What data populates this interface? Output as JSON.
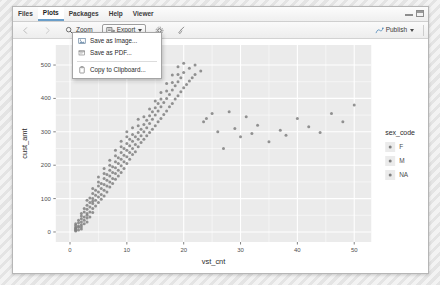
{
  "window": {
    "tabs": [
      {
        "label": "Files",
        "active": false
      },
      {
        "label": "Plots",
        "active": true
      },
      {
        "label": "Packages",
        "active": false
      },
      {
        "label": "Help",
        "active": false
      },
      {
        "label": "Viewer",
        "active": false
      }
    ],
    "controls": {
      "minimize": "minimize-icon",
      "maximize": "maximize-icon"
    }
  },
  "toolbar": {
    "back_label": "",
    "forward_label": "",
    "zoom_label": "Zoom",
    "export_label": "Export",
    "remove_label": "",
    "clear_label": "",
    "publish_label": "Publish",
    "icons": {
      "back": "arrow-left-icon",
      "forward": "arrow-right-icon",
      "zoom": "magnifier-icon",
      "export": "export-icon",
      "remove": "gear-icon",
      "clear": "broom-icon",
      "publish": "publish-icon"
    }
  },
  "export_menu": {
    "open": true,
    "items": [
      {
        "label": "Save as Image...",
        "icon": "image-icon"
      },
      {
        "label": "Save as PDF...",
        "icon": "pdf-icon"
      },
      {
        "label": "Copy to Clipboard...",
        "icon": "clipboard-icon"
      }
    ]
  },
  "chart_data": {
    "type": "scatter",
    "title": "",
    "xlabel": "vst_cnt",
    "ylabel": "cust_amt",
    "xlim": [
      -2.5,
      53
    ],
    "ylim": [
      -30,
      560
    ],
    "xticks": [
      0,
      10,
      20,
      30,
      40,
      50
    ],
    "yticks": [
      0,
      100,
      200,
      300,
      400,
      500
    ],
    "grid": true,
    "panel_bg": "#ebebeb",
    "grid_color": "#ffffff",
    "point_color": "#808080",
    "legend": {
      "title": "sex_code",
      "position": "right",
      "entries": [
        {
          "label": "F",
          "color": "#7f7f7f"
        },
        {
          "label": "M",
          "color": "#7f7f7f"
        },
        {
          "label": "NA",
          "color": "#7f7f7f"
        }
      ]
    },
    "series": [
      {
        "name": "sex_code",
        "points": [
          [
            1,
            5
          ],
          [
            1,
            8
          ],
          [
            1,
            12
          ],
          [
            1,
            15
          ],
          [
            1,
            3
          ],
          [
            1,
            20
          ],
          [
            1,
            25
          ],
          [
            1,
            10
          ],
          [
            1.5,
            18
          ],
          [
            1.5,
            28
          ],
          [
            1.5,
            6
          ],
          [
            1.5,
            35
          ],
          [
            1.5,
            14
          ],
          [
            2,
            22
          ],
          [
            2,
            30
          ],
          [
            2,
            40
          ],
          [
            2,
            16
          ],
          [
            2,
            48
          ],
          [
            2,
            9
          ],
          [
            2,
            55
          ],
          [
            2.5,
            35
          ],
          [
            2.5,
            45
          ],
          [
            2.5,
            60
          ],
          [
            2.5,
            25
          ],
          [
            2.5,
            70
          ],
          [
            3,
            42
          ],
          [
            3,
            55
          ],
          [
            3,
            68
          ],
          [
            3,
            80
          ],
          [
            3,
            30
          ],
          [
            3,
            95
          ],
          [
            3,
            50
          ],
          [
            3.5,
            60
          ],
          [
            3.5,
            75
          ],
          [
            3.5,
            88
          ],
          [
            3.5,
            45
          ],
          [
            3.5,
            102
          ],
          [
            4,
            70
          ],
          [
            4,
            85
          ],
          [
            4,
            100
          ],
          [
            4,
            58
          ],
          [
            4,
            115
          ],
          [
            4,
            130
          ],
          [
            4,
            92
          ],
          [
            4.5,
            95
          ],
          [
            4.5,
            110
          ],
          [
            4.5,
            78
          ],
          [
            4.5,
            125
          ],
          [
            5,
            105
          ],
          [
            5,
            120
          ],
          [
            5,
            138
          ],
          [
            5,
            88
          ],
          [
            5,
            150
          ],
          [
            5,
            165
          ],
          [
            5.5,
            112
          ],
          [
            5.5,
            130
          ],
          [
            5.5,
            145
          ],
          [
            5.5,
            98
          ],
          [
            6,
            125
          ],
          [
            6,
            142
          ],
          [
            6,
            160
          ],
          [
            6,
            175
          ],
          [
            6,
            108
          ],
          [
            6,
            190
          ],
          [
            6.5,
            138
          ],
          [
            6.5,
            155
          ],
          [
            6.5,
            172
          ],
          [
            6.5,
            120
          ],
          [
            7,
            150
          ],
          [
            7,
            168
          ],
          [
            7,
            185
          ],
          [
            7,
            135
          ],
          [
            7,
            200
          ],
          [
            7,
            215
          ],
          [
            7.5,
            160
          ],
          [
            7.5,
            178
          ],
          [
            7.5,
            195
          ],
          [
            7.5,
            145
          ],
          [
            8,
            175
          ],
          [
            8,
            192
          ],
          [
            8,
            210
          ],
          [
            8,
            158
          ],
          [
            8,
            228
          ],
          [
            8,
            245
          ],
          [
            8.5,
            185
          ],
          [
            8.5,
            205
          ],
          [
            8.5,
            222
          ],
          [
            8.5,
            168
          ],
          [
            9,
            198
          ],
          [
            9,
            218
          ],
          [
            9,
            238
          ],
          [
            9,
            178
          ],
          [
            9,
            255
          ],
          [
            9,
            272
          ],
          [
            9.5,
            210
          ],
          [
            9.5,
            230
          ],
          [
            9.5,
            250
          ],
          [
            9.5,
            190
          ],
          [
            10,
            225
          ],
          [
            10,
            245
          ],
          [
            10,
            265
          ],
          [
            10,
            205
          ],
          [
            10,
            285
          ],
          [
            10,
            300
          ],
          [
            10.5,
            238
          ],
          [
            10.5,
            258
          ],
          [
            10.5,
            278
          ],
          [
            10.5,
            218
          ],
          [
            11,
            250
          ],
          [
            11,
            272
          ],
          [
            11,
            292
          ],
          [
            11,
            232
          ],
          [
            11,
            312
          ],
          [
            11.5,
            262
          ],
          [
            11.5,
            285
          ],
          [
            11.5,
            240
          ],
          [
            12,
            278
          ],
          [
            12,
            298
          ],
          [
            12,
            255
          ],
          [
            12,
            318
          ],
          [
            12,
            338
          ],
          [
            12.5,
            288
          ],
          [
            12.5,
            308
          ],
          [
            12.5,
            268
          ],
          [
            13,
            300
          ],
          [
            13,
            322
          ],
          [
            13,
            278
          ],
          [
            13,
            345
          ],
          [
            13.5,
            312
          ],
          [
            13.5,
            335
          ],
          [
            13.5,
            288
          ],
          [
            14,
            325
          ],
          [
            14,
            348
          ],
          [
            14,
            298
          ],
          [
            14,
            368
          ],
          [
            14.5,
            338
          ],
          [
            14.5,
            360
          ],
          [
            14.5,
            308
          ],
          [
            15,
            350
          ],
          [
            15,
            372
          ],
          [
            15,
            318
          ],
          [
            15,
            392
          ],
          [
            15.5,
            362
          ],
          [
            15.5,
            385
          ],
          [
            15.5,
            330
          ],
          [
            16,
            375
          ],
          [
            16,
            398
          ],
          [
            16,
            340
          ],
          [
            16,
            418
          ],
          [
            16.5,
            388
          ],
          [
            16.5,
            352
          ],
          [
            17,
            400
          ],
          [
            17,
            422
          ],
          [
            17,
            362
          ],
          [
            17,
            445
          ],
          [
            17.5,
            412
          ],
          [
            17.5,
            375
          ],
          [
            18,
            425
          ],
          [
            18,
            448
          ],
          [
            18,
            385
          ],
          [
            18,
            470
          ],
          [
            18.5,
            438
          ],
          [
            18.5,
            398
          ],
          [
            19,
            450
          ],
          [
            19,
            472
          ],
          [
            19,
            408
          ],
          [
            19,
            495
          ],
          [
            19.5,
            462
          ],
          [
            19.5,
            420
          ],
          [
            20,
            478
          ],
          [
            20,
            432
          ],
          [
            20,
            505
          ],
          [
            20.5,
            442
          ],
          [
            21,
            490
          ],
          [
            21,
            452
          ],
          [
            21.5,
            462
          ],
          [
            22,
            500
          ],
          [
            22,
            472
          ],
          [
            23,
            482
          ],
          [
            23.5,
            330
          ],
          [
            24,
            340
          ],
          [
            25,
            355
          ],
          [
            26,
            300
          ],
          [
            27,
            250
          ],
          [
            28,
            360
          ],
          [
            29,
            310
          ],
          [
            30,
            285
          ],
          [
            31,
            345
          ],
          [
            32,
            295
          ],
          [
            33,
            320
          ],
          [
            35,
            270
          ],
          [
            37,
            305
          ],
          [
            38,
            290
          ],
          [
            40,
            340
          ],
          [
            42,
            315
          ],
          [
            44,
            298
          ],
          [
            46,
            355
          ],
          [
            48,
            330
          ],
          [
            50,
            380
          ]
        ]
      }
    ]
  }
}
